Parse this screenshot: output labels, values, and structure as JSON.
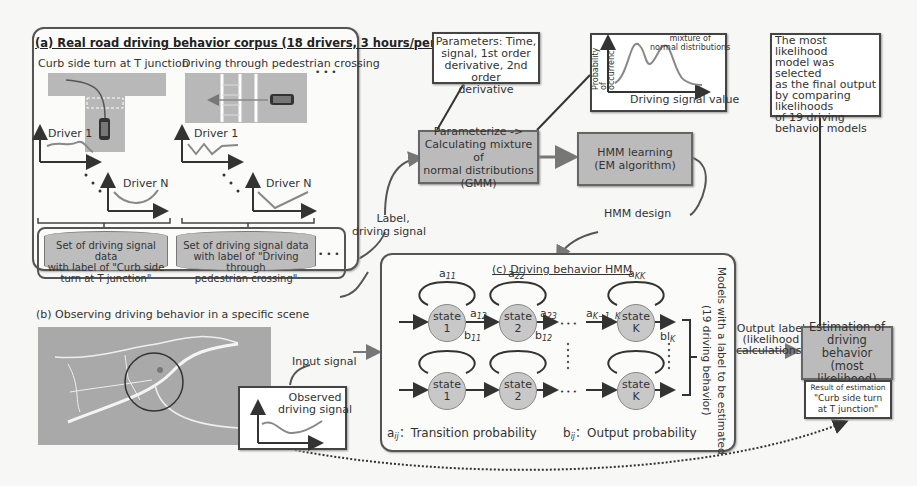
{
  "panel_a": {
    "title": "(a) Real road driving behavior corpus (18 drivers, 3 hours/person)",
    "scene1_label": "Curb side turn at T junction",
    "scene2_label": "Driving through pedestrian crossing",
    "ellipsis": "• • •",
    "driver1": "Driver 1",
    "driverN": "Driver N",
    "dataset1": [
      "Set of driving signal data",
      "with label of \"Curb side",
      "turn at T junction\""
    ],
    "dataset2": [
      "Set of driving signal data",
      "with label of \"Driving through",
      "pedestrian crossing\""
    ],
    "dataset_more": "• • •"
  },
  "label_driving_signal": [
    "Label,",
    "driving signal"
  ],
  "parameters_box": [
    "Parameters: Time,",
    "signal, 1st order",
    "derivative, 2nd order",
    "derivative"
  ],
  "gmm_plot": {
    "ylabel": "Probability of occurrence",
    "xlabel": "Driving signal value",
    "annotation": [
      "mixture of",
      "normal distributions"
    ]
  },
  "selection_note": [
    "The most likelihood",
    "model was selected",
    "as the final output",
    "by comparing",
    "likelihoods",
    "of 19 driving",
    "behavior models"
  ],
  "parameterize_box": [
    "Parameterize ->",
    "Calculating  mixture of",
    "normal distributions",
    "(GMM)"
  ],
  "hmm_learning_box": [
    "HMM learning",
    "(EM algorithm)"
  ],
  "hmm_design_label": "HMM design",
  "panel_b": {
    "title": "(b) Observing driving behavior in a specific scene",
    "input_signal": "Input signal",
    "observed_signal": [
      "Observed",
      "driving signal"
    ]
  },
  "panel_c": {
    "title": "(c) Driving behavior HMM",
    "state_word": "state",
    "states": [
      "1",
      "2",
      "K"
    ],
    "a11": "a",
    "a11_sub": "11",
    "a22": "a",
    "a22_sub": "22",
    "aKK": "a",
    "aKK_sub": "KK",
    "a12": "a",
    "a12_sub": "12",
    "a23": "a",
    "a23_sub": "23",
    "aK1K": "a",
    "aK1K_sub": "K−1, K",
    "b11": "b",
    "b11_sub": "11",
    "b12": "b",
    "b12_sub": "12",
    "bK": "bl",
    "bK_sub": "K",
    "ellipsis": "• • •",
    "legend_a": "a",
    "legend_a_sub": "ij",
    "legend_a_text": "：Transition probability",
    "legend_b": "b",
    "legend_b_sub": "ij",
    "legend_b_text": "：Output probability",
    "side_label": [
      "Models with a label to be estimated",
      "(19 driving behavior)"
    ]
  },
  "output_label": [
    "Output label",
    "(likelihood",
    "calculations)"
  ],
  "estimation_box": [
    "Estimation of",
    "driving behavior",
    "(most likelihood)"
  ],
  "result_box": [
    "Result of  estimation",
    "\"Curb side turn",
    "at T junction\""
  ]
}
